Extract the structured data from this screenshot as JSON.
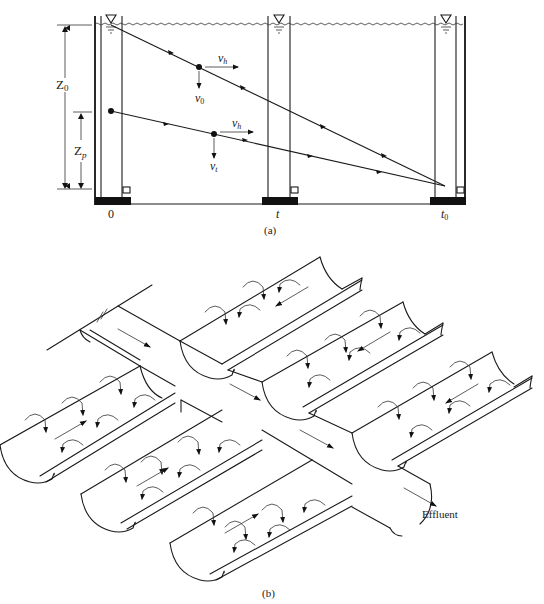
{
  "figure": {
    "part_a": {
      "caption": "(a)",
      "dimension_labels": {
        "total_depth": "Z",
        "total_depth_sub": "0",
        "particle_depth": "Z",
        "particle_depth_sub": "p"
      },
      "velocity_labels": {
        "upper_horizontal": "v",
        "upper_horizontal_sub": "h",
        "upper_settling": "v",
        "upper_settling_sub": "0",
        "lower_horizontal": "v",
        "lower_horizontal_sub": "h",
        "lower_settling": "v",
        "lower_settling_sub": "t"
      },
      "time_labels": {
        "start": "0",
        "middle": "t",
        "end": "t",
        "end_sub": "0"
      },
      "water_surface_symbol": "▽"
    },
    "part_b": {
      "caption": "(b)",
      "outlet_label": "Effluent"
    }
  }
}
